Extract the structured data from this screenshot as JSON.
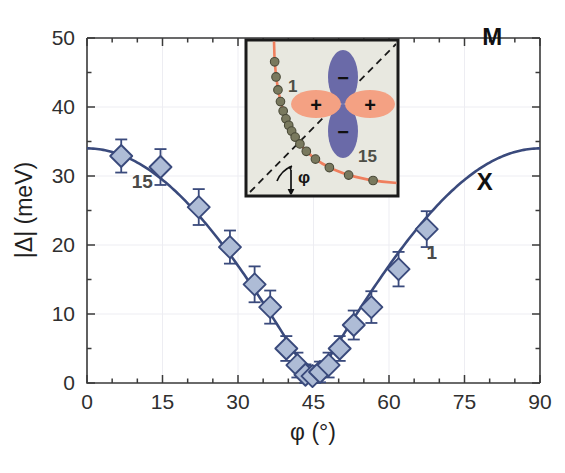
{
  "chart_data": {
    "type": "scatter",
    "title": "",
    "xlabel": "φ (°)",
    "ylabel": "|Δ| (meV)",
    "xlim": [
      0,
      90
    ],
    "ylim": [
      0,
      50
    ],
    "xticks": [
      0,
      15,
      30,
      45,
      60,
      75,
      90
    ],
    "xtick_labels": [
      "0",
      "15",
      "30",
      "45",
      "60",
      "75",
      "90"
    ],
    "xminor_step": 5,
    "yticks": [
      0,
      10,
      20,
      30,
      40,
      50
    ],
    "ytick_labels": [
      "0",
      "10",
      "20",
      "30",
      "40",
      "50"
    ],
    "yminor_step": 5,
    "grid": "faint-major",
    "legend": "none",
    "marker": "diamond",
    "marker_face_color": "#aebcd6",
    "marker_edge_color": "#3a4a7c",
    "line_color": "#3a4a7c",
    "error_bar_color": "#3a4a7c",
    "x": [
      6.8,
      14.6,
      22.2,
      28.4,
      33.3,
      36.4,
      39.6,
      41.8,
      43.4,
      44.8,
      46.3,
      48.0,
      50.2,
      53.0,
      56.5,
      61.9,
      67.5
    ],
    "y": [
      32.9,
      31.3,
      25.5,
      19.7,
      14.3,
      11.0,
      5.0,
      2.6,
      1.2,
      1.0,
      1.6,
      2.6,
      5.0,
      8.4,
      11.0,
      16.5,
      22.3
    ],
    "yerr": [
      2.4,
      2.6,
      2.6,
      2.4,
      2.6,
      2.4,
      1.8,
      1.8,
      1.5,
      1.5,
      1.5,
      1.8,
      1.8,
      2.1,
      2.3,
      2.5,
      2.6
    ],
    "fit_curve": {
      "description": "d-wave form |Δ| = 34 * |cos(2φ)|",
      "amplitude": 34,
      "formula": "34*|cos(2*phi)|",
      "color": "#3a4a7c"
    },
    "annotations": [
      {
        "text": "15",
        "x": 11.0,
        "y": 28.2,
        "name": "point-label-15-left"
      },
      {
        "text": "1",
        "x": 68.5,
        "y": 18.0,
        "name": "point-label-1-right"
      },
      {
        "text": "Γ",
        "x": 44.0,
        "y": 28.0,
        "name": "bz-point-gamma"
      },
      {
        "text": "X",
        "x": 79.0,
        "y": 28.0,
        "name": "bz-point-x"
      },
      {
        "text": "M",
        "x": 80.5,
        "y": 49.0,
        "name": "bz-point-m"
      }
    ]
  },
  "inset": {
    "name": "brillouin-zone-inset",
    "background_color": "#e8e8e0",
    "border_color": "#1a1a1a",
    "fermi_surface_color": "#ef7f5e",
    "node_marker_color": "#79795e",
    "diagonal_color": "#1a1a1a",
    "labels": {
      "first_point": "1",
      "last_point": "15",
      "angle": "φ"
    },
    "orbital": {
      "name": "d-wave-orbital",
      "positive_lobe_color": "#f4a183",
      "negative_lobe_color": "#6a6aa8",
      "positive_sign": "+",
      "negative_sign": "−"
    },
    "fermi_points_count": 15
  },
  "axes": {
    "x_title": "φ (°)",
    "y_title": "|Δ| (meV)"
  }
}
